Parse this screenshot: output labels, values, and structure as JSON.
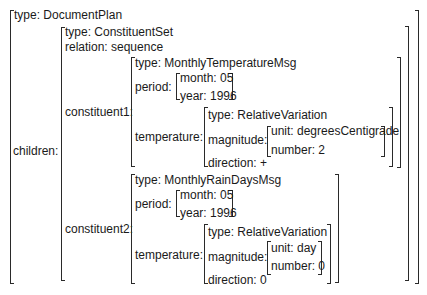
{
  "avm": {
    "root": {
      "type_line": "type: DocumentPlan",
      "children_label": "children:"
    },
    "constituent_set": {
      "type_line": "type: ConstituentSet",
      "relation_line": "relation: sequence",
      "constituent1_label": "constituent1:",
      "constituent2_label": "constituent2:"
    },
    "constituent1": {
      "type_line": "type: MonthlyTemperatureMsg",
      "period_label": "period:",
      "month_line": "month: 05",
      "year_line": "year: 1996",
      "temperature_label": "temperature:",
      "variation": {
        "type_line": "type: RelativeVariation",
        "magnitude_label": "magnitude:",
        "unit_line": "unit: degreesCentigrade",
        "number_line": "number: 2",
        "direction_line": "direction: +"
      }
    },
    "constituent2": {
      "type_line": "type: MonthlyRainDaysMsg",
      "period_label": "period:",
      "month_line": "month: 05",
      "year_line": "year: 1996",
      "temperature_label": "temperature:",
      "variation": {
        "type_line": "type: RelativeVariation",
        "magnitude_label": "magnitude:",
        "unit_line": "unit: day",
        "number_line": "number: 0",
        "direction_line": "direction: 0"
      }
    }
  }
}
